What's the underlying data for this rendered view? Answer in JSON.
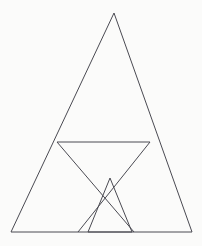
{
  "document": {
    "title": "Nested Triangles Geometric Figure",
    "background_color": "#fbfbfa",
    "canvas_width": 202,
    "canvas_height": 246
  },
  "figure": {
    "name": "nested-triangles",
    "stroke_color": "#4a4a52",
    "stroke_width": 1,
    "points": {
      "apex": {
        "x": 114,
        "y": 13
      },
      "base_left": {
        "x": 11,
        "y": 232
      },
      "base_right": {
        "x": 192,
        "y": 232
      },
      "chord_left": {
        "x": 57,
        "y": 142
      },
      "chord_right": {
        "x": 150,
        "y": 142
      },
      "diagonal_left_foot": {
        "x": 134,
        "y": 232
      },
      "diagonal_right_foot": {
        "x": 78,
        "y": 232
      },
      "small_apex": {
        "x": 110,
        "y": 178
      },
      "small_left_foot": {
        "x": 88,
        "y": 232
      },
      "small_right_foot": {
        "x": 132,
        "y": 232
      }
    },
    "shapes": [
      {
        "id": "outer-triangle",
        "label": "Outer large triangle",
        "type": "polygon",
        "points": "114,13 192,232 11,232"
      },
      {
        "id": "horizontal-chord",
        "label": "Horizontal chord line",
        "type": "line",
        "points": "57,142 150,142"
      },
      {
        "id": "diagonal-left-to-right",
        "label": "Diagonal from chord left end to base right-of-center",
        "type": "line",
        "points": "57,142 134,232"
      },
      {
        "id": "diagonal-right-to-left",
        "label": "Diagonal from chord right end to base left-of-center",
        "type": "line",
        "points": "150,142 78,232"
      },
      {
        "id": "small-triangle",
        "label": "Small inner triangle near base",
        "type": "polygon",
        "points": "110,178 132,232 88,232"
      }
    ]
  }
}
